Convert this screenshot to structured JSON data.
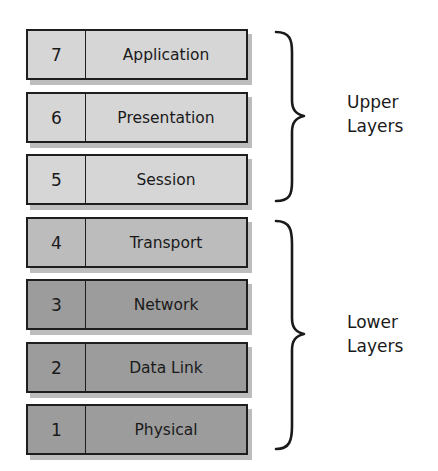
{
  "diagram": {
    "layers": [
      {
        "number": "7",
        "name": "Application",
        "group": "upper",
        "color": "#d6d6d6"
      },
      {
        "number": "6",
        "name": "Presentation",
        "group": "upper",
        "color": "#d6d6d6"
      },
      {
        "number": "5",
        "name": "Session",
        "group": "upper",
        "color": "#d6d6d6"
      },
      {
        "number": "4",
        "name": "Transport",
        "group": "lower",
        "color": "#bcbcbc"
      },
      {
        "number": "3",
        "name": "Network",
        "group": "lower",
        "color": "#9c9c9c"
      },
      {
        "number": "2",
        "name": "Data Link",
        "group": "lower",
        "color": "#9c9c9c"
      },
      {
        "number": "1",
        "name": "Physical",
        "group": "lower",
        "color": "#9c9c9c"
      }
    ],
    "groups": {
      "upper": {
        "line1": "Upper",
        "line2": "Layers"
      },
      "lower": {
        "line1": "Lower",
        "line2": "Layers"
      }
    }
  }
}
